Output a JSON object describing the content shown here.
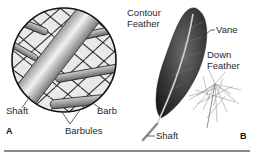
{
  "figure": {
    "panel_a": {
      "letter": "A",
      "labels": {
        "shaft": "Shaft",
        "barb": "Barb",
        "barbules": "Barbules"
      },
      "subject": "magnified feather structure"
    },
    "panel_b": {
      "letter": "B",
      "labels": {
        "contour_feather_line1": "Contour",
        "contour_feather_line2": "Feather",
        "vane": "Vane",
        "down_feather_line1": "Down",
        "down_feather_line2": "Feather",
        "shaft": "Shaft"
      }
    },
    "colors": {
      "ink": "#222222",
      "rule": "#8a8a8a",
      "feather_dark": "#2e2e2e",
      "down_gray": "#9a9a9a"
    }
  }
}
